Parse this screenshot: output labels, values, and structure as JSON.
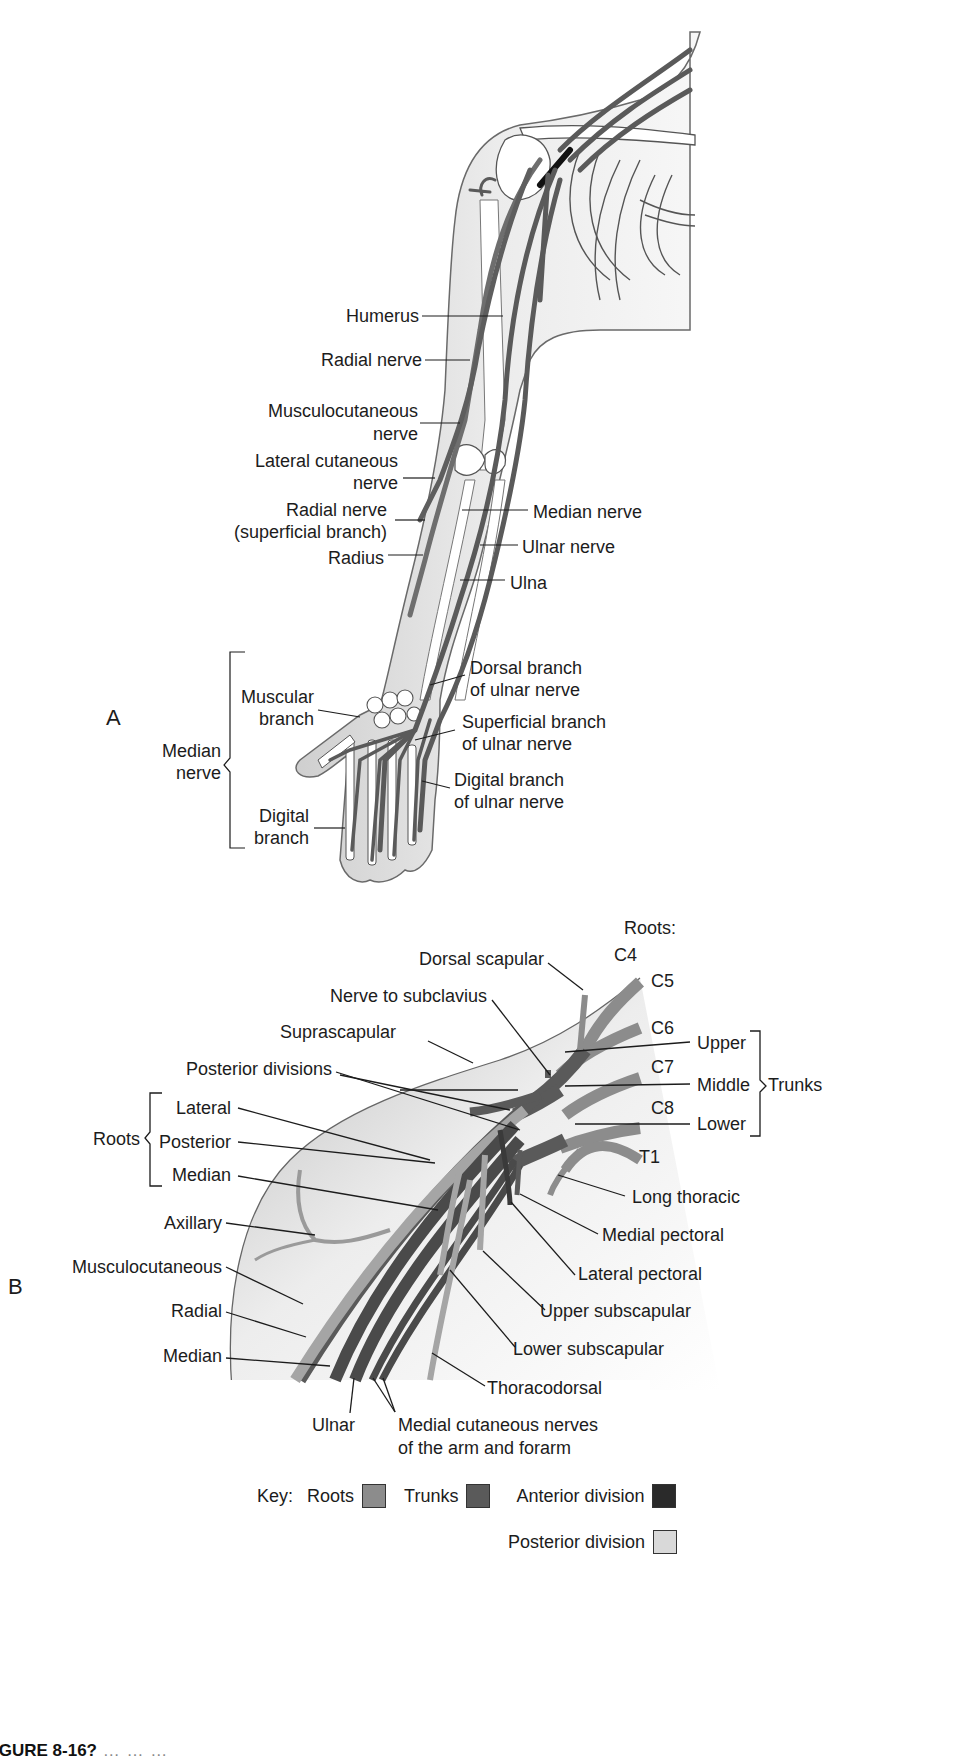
{
  "figure": {
    "caption_visible": "IGURE 8-16?",
    "caption_rest": "  …  …  …",
    "colors": {
      "roots": "#8c8c8c",
      "trunks": "#5a5a5a",
      "anterior_division": "#2a2a2a",
      "posterior_division": "#d9d9d9",
      "skin": "#e6e6e6",
      "bone": "#ffffff",
      "outline": "#555555"
    }
  },
  "panel_a": {
    "letter": "A",
    "labels": {
      "humerus": "Humerus",
      "radial_nerve": "Radial nerve",
      "musculocutaneous_1": "Musculocutaneous",
      "musculocutaneous_2": "nerve",
      "lateral_cutaneous_1": "Lateral cutaneous",
      "lateral_cutaneous_2": "nerve",
      "radial_superficial_1": "Radial nerve",
      "radial_superficial_2": "(superficial branch)",
      "radius": "Radius",
      "median_nerve": "Median nerve",
      "ulnar_nerve": "Ulnar nerve",
      "ulna": "Ulna",
      "dorsal_branch_1": "Dorsal branch",
      "dorsal_branch_2": "of ulnar nerve",
      "superficial_branch_1": "Superficial branch",
      "superficial_branch_2": "of ulnar nerve",
      "digital_ulnar_1": "Digital branch",
      "digital_ulnar_2": "of ulnar nerve",
      "muscular_branch_1": "Muscular",
      "muscular_branch_2": "branch",
      "median_group_1": "Median",
      "median_group_2": "nerve",
      "digital_branch_1": "Digital",
      "digital_branch_2": "branch"
    }
  },
  "panel_b": {
    "letter": "B",
    "labels": {
      "roots_heading": "Roots:",
      "c4": "C4",
      "c5": "C5",
      "c6": "C6",
      "c7": "C7",
      "c8": "C8",
      "t1": "T1",
      "dorsal_scapular": "Dorsal scapular",
      "nerve_to_subclavius": "Nerve to subclavius",
      "suprascapular": "Suprascapular",
      "posterior_divisions": "Posterior divisions",
      "upper": "Upper",
      "middle": "Middle",
      "lower": "Lower",
      "trunks": "Trunks",
      "roots_group": "Roots",
      "lateral": "Lateral",
      "posterior": "Posterior",
      "median_root": "Median",
      "axillary": "Axillary",
      "musculocutaneous": "Musculocutaneous",
      "radial": "Radial",
      "median": "Median",
      "ulnar": "Ulnar",
      "medial_cutaneous_1": "Medial cutaneous nerves",
      "medial_cutaneous_2": "of the arm and forarm",
      "long_thoracic": "Long thoracic",
      "medial_pectoral": "Medial pectoral",
      "lateral_pectoral": "Lateral pectoral",
      "upper_subscapular": "Upper subscapular",
      "lower_subscapular": "Lower subscapular",
      "thoracodorsal": "Thoracodorsal"
    }
  },
  "key": {
    "title": "Key:",
    "items": [
      {
        "label": "Roots",
        "color": "#8c8c8c"
      },
      {
        "label": "Trunks",
        "color": "#5a5a5a"
      },
      {
        "label": "Anterior division",
        "color": "#2a2a2a"
      },
      {
        "label": "Posterior division",
        "color": "#d9d9d9"
      }
    ]
  }
}
